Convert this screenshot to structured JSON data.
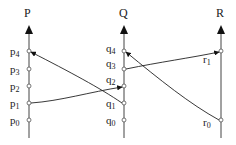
{
  "diagram": {
    "type": "space-time message diagram",
    "processes": [
      {
        "name": "P",
        "x": 29,
        "events": [
          {
            "label": "p",
            "sub": "0",
            "y": 120
          },
          {
            "label": "p",
            "sub": "1",
            "y": 103
          },
          {
            "label": "p",
            "sub": "2",
            "y": 86
          },
          {
            "label": "p",
            "sub": "3",
            "y": 69
          },
          {
            "label": "p",
            "sub": "4",
            "y": 51
          }
        ]
      },
      {
        "name": "Q",
        "x": 124,
        "events": [
          {
            "label": "q",
            "sub": "0",
            "y": 120
          },
          {
            "label": "q",
            "sub": "1",
            "y": 103
          },
          {
            "label": "q",
            "sub": "2",
            "y": 86
          },
          {
            "label": "q",
            "sub": "3",
            "y": 69
          },
          {
            "label": "q",
            "sub": "4",
            "y": 51
          }
        ]
      },
      {
        "name": "R",
        "x": 221,
        "events": [
          {
            "label": "r",
            "sub": "0",
            "y": 120
          },
          {
            "label": "r",
            "sub": "1",
            "y": 51
          }
        ]
      }
    ],
    "messages": [
      {
        "from": "p1",
        "to": "q2"
      },
      {
        "from": "q1",
        "to": "p4"
      },
      {
        "from": "q3",
        "to": "r1"
      },
      {
        "from": "r0",
        "to": "q4"
      }
    ]
  }
}
